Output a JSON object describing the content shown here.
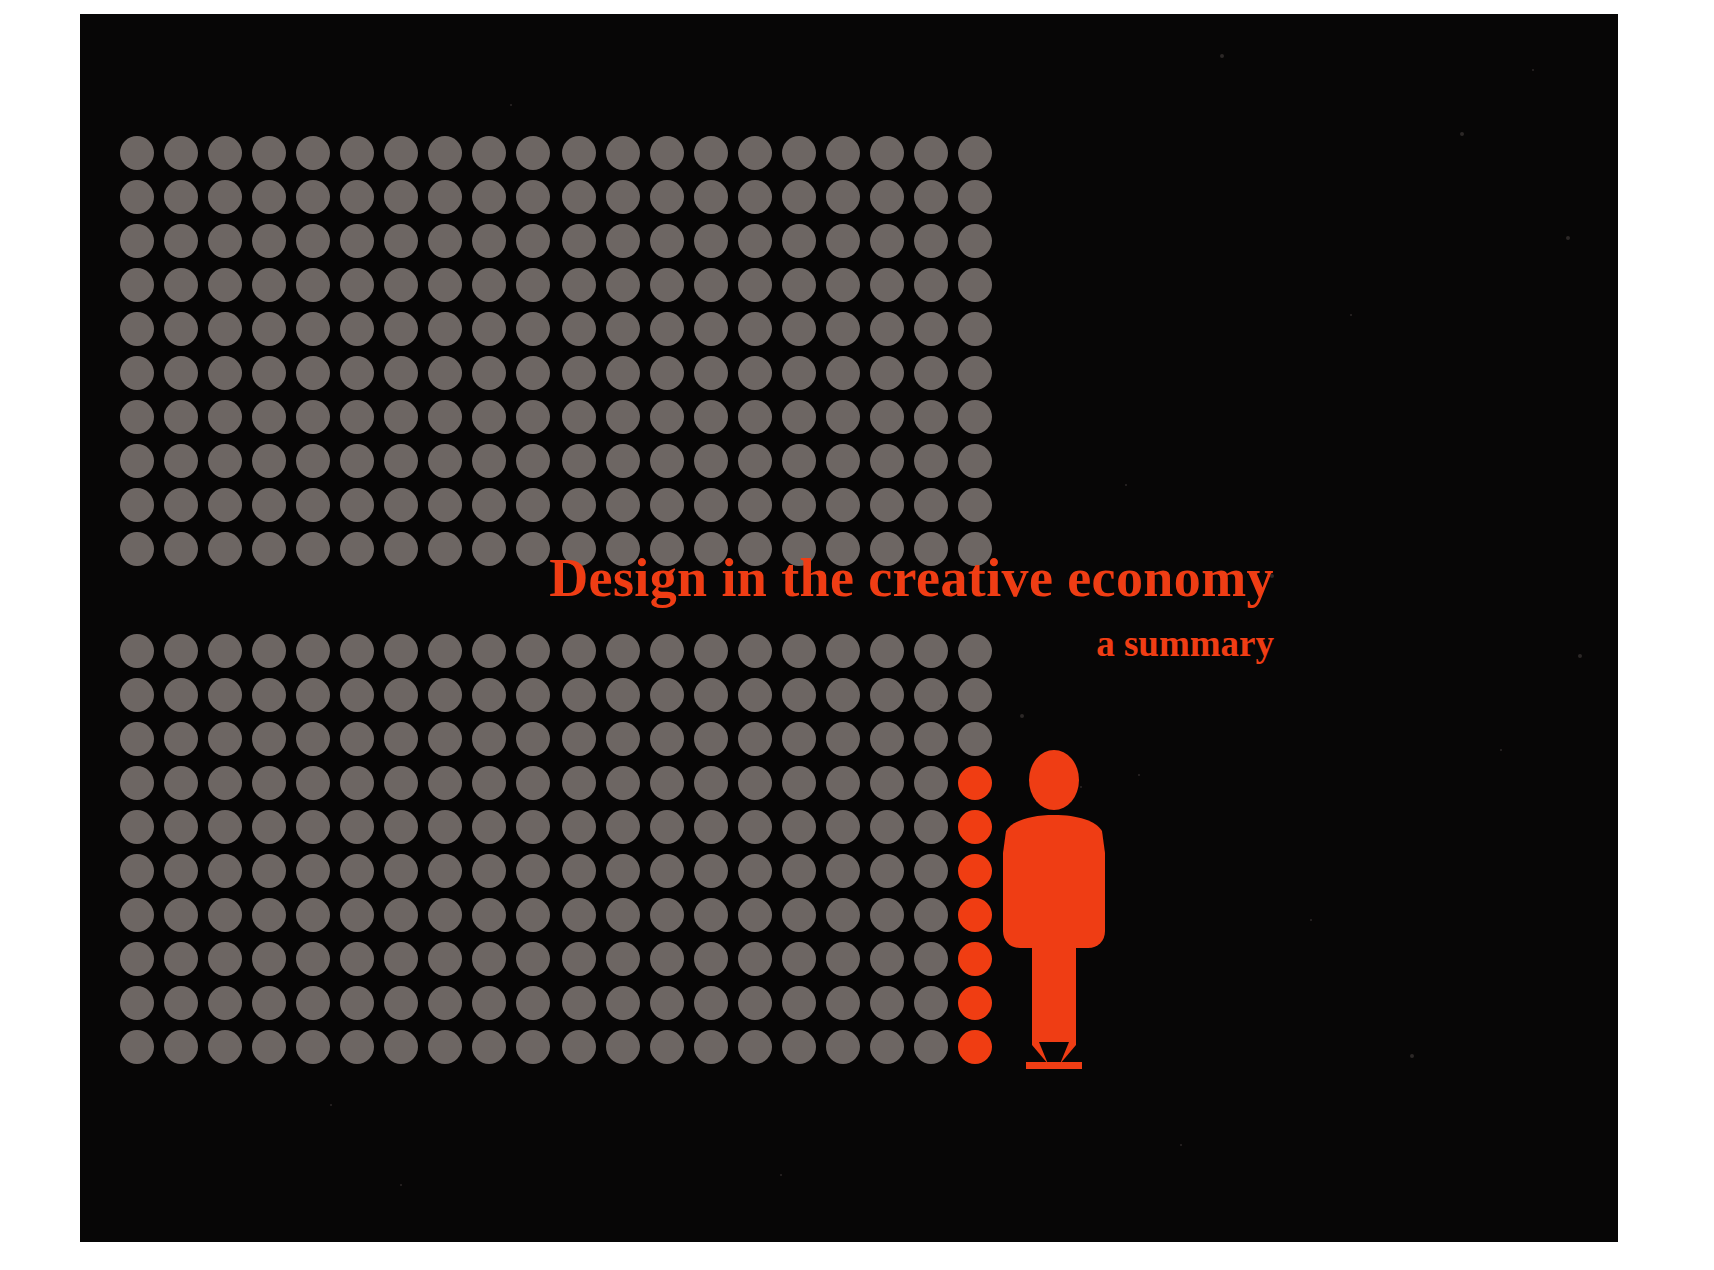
{
  "poster": {
    "background_color": "#070606",
    "accent_color": "#ef3d14",
    "dot_color": "#6d6663",
    "title": "Design in the creative economy",
    "subtitle": "a summary"
  },
  "dot_grids": [
    {
      "id": "grid-tl",
      "name": "dot-grid-top-left",
      "rows": 10,
      "cols": 10,
      "dot_diameter": 34,
      "pitch": 44,
      "accent_cells": []
    },
    {
      "id": "grid-tr",
      "name": "dot-grid-top-right",
      "rows": 10,
      "cols": 10,
      "dot_diameter": 34,
      "pitch": 44,
      "accent_cells": []
    },
    {
      "id": "grid-bl",
      "name": "dot-grid-bottom-left",
      "rows": 10,
      "cols": 10,
      "dot_diameter": 34,
      "pitch": 44,
      "accent_cells": []
    },
    {
      "id": "grid-br",
      "name": "dot-grid-bottom-right",
      "rows": 10,
      "cols": 10,
      "dot_diameter": 34,
      "pitch": 44,
      "accent_cells": [
        [
          3,
          9
        ],
        [
          4,
          9
        ],
        [
          5,
          9
        ],
        [
          6,
          9
        ],
        [
          7,
          9
        ],
        [
          8,
          9
        ],
        [
          9,
          9
        ]
      ]
    }
  ],
  "figure": {
    "name": "pencil-person-pictogram",
    "color": "#ef3d14",
    "parts": [
      "head",
      "torso",
      "pencil-body",
      "pencil-tip",
      "pencil-mark"
    ]
  },
  "specks": [
    {
      "x": 1140,
      "y": 40,
      "r": 2
    },
    {
      "x": 1380,
      "y": 118,
      "r": 2
    },
    {
      "x": 1452,
      "y": 55,
      "r": 1
    },
    {
      "x": 1486,
      "y": 222,
      "r": 2
    },
    {
      "x": 1270,
      "y": 300,
      "r": 1
    },
    {
      "x": 1045,
      "y": 470,
      "r": 1
    },
    {
      "x": 1190,
      "y": 560,
      "r": 2
    },
    {
      "x": 1498,
      "y": 640,
      "r": 2
    },
    {
      "x": 1420,
      "y": 735,
      "r": 1
    },
    {
      "x": 860,
      "y": 690,
      "r": 1
    },
    {
      "x": 940,
      "y": 700,
      "r": 2
    },
    {
      "x": 1000,
      "y": 772,
      "r": 1
    },
    {
      "x": 1058,
      "y": 760,
      "r": 1
    },
    {
      "x": 1230,
      "y": 905,
      "r": 1
    },
    {
      "x": 1330,
      "y": 1040,
      "r": 2
    },
    {
      "x": 1100,
      "y": 1130,
      "r": 1
    },
    {
      "x": 700,
      "y": 1160,
      "r": 1
    },
    {
      "x": 320,
      "y": 1170,
      "r": 1
    },
    {
      "x": 430,
      "y": 90,
      "r": 1
    },
    {
      "x": 250,
      "y": 1090,
      "r": 1
    }
  ]
}
